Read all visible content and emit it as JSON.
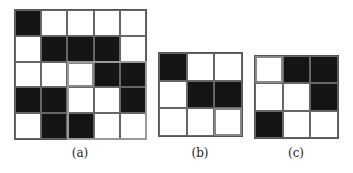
{
  "panels": [
    {
      "id": "a",
      "caption": "(a)",
      "rows": 5,
      "cols": 5,
      "cells": [
        [
          1,
          0,
          0,
          0,
          0
        ],
        [
          0,
          1,
          1,
          1,
          0
        ],
        [
          0,
          0,
          0,
          1,
          1
        ],
        [
          1,
          1,
          0,
          0,
          1
        ],
        [
          0,
          1,
          1,
          0,
          0
        ]
      ],
      "highlight_cell": [
        2,
        2
      ],
      "highlight_subgrid": {
        "row": 2,
        "col": 2,
        "rows": 3,
        "cols": 3
      }
    },
    {
      "id": "b",
      "caption": "(b)",
      "rows": 3,
      "cols": 3,
      "cells": [
        [
          1,
          0,
          0
        ],
        [
          0,
          1,
          1
        ],
        [
          0,
          0,
          0
        ]
      ],
      "highlight_cell": [
        2,
        2
      ]
    },
    {
      "id": "c",
      "caption": "(c)",
      "rows": 3,
      "cols": 3,
      "cells": [
        [
          0,
          1,
          1
        ],
        [
          0,
          0,
          1
        ],
        [
          1,
          0,
          0
        ]
      ],
      "highlight_cell": [
        0,
        0
      ]
    }
  ],
  "colors": {
    "black": "#151515",
    "white": "#ffffff",
    "highlight": "#999999",
    "grid_line": "#666666"
  }
}
